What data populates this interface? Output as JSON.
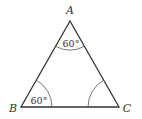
{
  "diagram": {
    "type": "triangle",
    "vertices": {
      "A": {
        "label": "A"
      },
      "B": {
        "label": "B"
      },
      "C": {
        "label": "C"
      }
    },
    "angles": {
      "A": {
        "label": "60°",
        "marked": true
      },
      "B": {
        "label": "60°",
        "marked": true
      },
      "C": {
        "label": "",
        "marked": true
      }
    },
    "stroke_color": "#333333"
  }
}
